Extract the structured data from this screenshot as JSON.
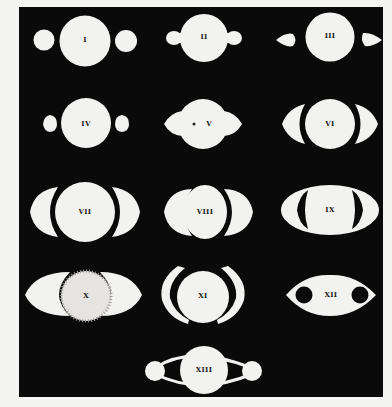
{
  "plate": {
    "subject": "Appearances of Saturn (historical telescopic drawings)",
    "background_color": "#0a0a0a",
    "figure_color": "#f2f2f0",
    "page_color": "#f4f4f2"
  },
  "figures": [
    {
      "id": "I",
      "label": "I",
      "description": "Globe with two detached round companions"
    },
    {
      "id": "II",
      "label": "II",
      "description": "Globe with attached rounded handles"
    },
    {
      "id": "III",
      "label": "III",
      "description": "Globe with two detached teardrop ansae"
    },
    {
      "id": "IV",
      "label": "IV",
      "description": "Globe with two half-moon ansae"
    },
    {
      "id": "V",
      "label": "V",
      "description": "Globe with crescent ansae and dark spots"
    },
    {
      "id": "VI",
      "label": "VI",
      "description": "Globe with crescent arms"
    },
    {
      "id": "VII",
      "label": "VII",
      "description": "Globe with large crescent arms"
    },
    {
      "id": "VIII",
      "label": "VIII",
      "description": "Globe with tall crescent arms touching the globe"
    },
    {
      "id": "IX",
      "label": "IX",
      "description": "Elliptical ring surrounding globe with dark gaps"
    },
    {
      "id": "X",
      "label": "X",
      "description": "Stippled globe with thin elliptical ring"
    },
    {
      "id": "XI",
      "label": "XI",
      "description": "Globe between two tall crescent arcs"
    },
    {
      "id": "XII",
      "label": "XII",
      "description": "Elliptical disc with two dark holes"
    },
    {
      "id": "XIII",
      "label": "XIII",
      "description": "Globe with thin arcs connecting two side spheres"
    }
  ]
}
